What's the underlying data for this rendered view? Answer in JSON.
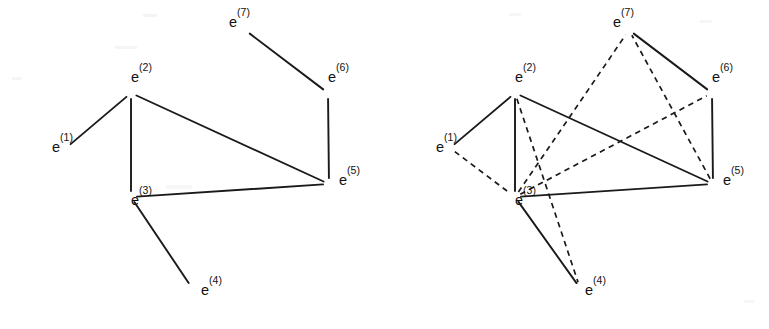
{
  "figure": {
    "title": "",
    "background_color": "#ffffff",
    "line_color": "#1a1a1a",
    "panels": [
      {
        "id": "left",
        "name": "left-graph",
        "caption": "",
        "origin_x": 0,
        "nodes": [
          {
            "id": "e1",
            "base": "e",
            "sup": "(1)",
            "label": "e(1)",
            "x": 52,
            "y": 152,
            "anchor_x": 66,
            "anchor_y": 148
          },
          {
            "id": "e2",
            "base": "e",
            "sup": "(2)",
            "label": "e(2)",
            "x": 131,
            "y": 82,
            "anchor_x": 131,
            "anchor_y": 93
          },
          {
            "id": "e3",
            "base": "e",
            "sup": "(3)",
            "label": "e(3)",
            "x": 131,
            "y": 205,
            "anchor_x": 131,
            "anchor_y": 197
          },
          {
            "id": "e4",
            "base": "e",
            "sup": "(4)",
            "label": "e(4)",
            "x": 201,
            "y": 295,
            "anchor_x": 192,
            "anchor_y": 288
          },
          {
            "id": "e5",
            "base": "e",
            "sup": "(5)",
            "label": "e(5)",
            "x": 339,
            "y": 185,
            "anchor_x": 329,
            "anchor_y": 184
          },
          {
            "id": "e6",
            "base": "e",
            "sup": "(6)",
            "label": "e(6)",
            "x": 328,
            "y": 82,
            "anchor_x": 328,
            "anchor_y": 93
          },
          {
            "id": "e7",
            "base": "e",
            "sup": "(7)",
            "label": "e(7)",
            "x": 229,
            "y": 27,
            "anchor_x": 245,
            "anchor_y": 30
          }
        ],
        "edges": [
          {
            "from": "e1",
            "to": "e2",
            "style": "solid"
          },
          {
            "from": "e2",
            "to": "e3",
            "style": "solid"
          },
          {
            "from": "e2",
            "to": "e5",
            "style": "solid"
          },
          {
            "from": "e3",
            "to": "e5",
            "style": "solid"
          },
          {
            "from": "e3",
            "to": "e4",
            "style": "solid"
          },
          {
            "from": "e5",
            "to": "e6",
            "style": "solid"
          },
          {
            "from": "e6",
            "to": "e7",
            "style": "solid"
          }
        ]
      },
      {
        "id": "right",
        "name": "right-graph",
        "caption": "",
        "origin_x": 384,
        "nodes": [
          {
            "id": "e1",
            "base": "e",
            "sup": "(1)",
            "label": "e(1)",
            "x": 52,
            "y": 152,
            "anchor_x": 66,
            "anchor_y": 148
          },
          {
            "id": "e2",
            "base": "e",
            "sup": "(2)",
            "label": "e(2)",
            "x": 131,
            "y": 82,
            "anchor_x": 131,
            "anchor_y": 93
          },
          {
            "id": "e3",
            "base": "e",
            "sup": "(3)",
            "label": "e(3)",
            "x": 131,
            "y": 205,
            "anchor_x": 131,
            "anchor_y": 197
          },
          {
            "id": "e4",
            "base": "e",
            "sup": "(4)",
            "label": "e(4)",
            "x": 201,
            "y": 295,
            "anchor_x": 196,
            "anchor_y": 288
          },
          {
            "id": "e5",
            "base": "e",
            "sup": "(5)",
            "label": "e(5)",
            "x": 339,
            "y": 185,
            "anchor_x": 329,
            "anchor_y": 184
          },
          {
            "id": "e6",
            "base": "e",
            "sup": "(6)",
            "label": "e(6)",
            "x": 328,
            "y": 82,
            "anchor_x": 328,
            "anchor_y": 93
          },
          {
            "id": "e7",
            "base": "e",
            "sup": "(7)",
            "label": "e(7)",
            "x": 229,
            "y": 27,
            "anchor_x": 245,
            "anchor_y": 30
          }
        ],
        "edges": [
          {
            "from": "e1",
            "to": "e2",
            "style": "solid"
          },
          {
            "from": "e2",
            "to": "e3",
            "style": "solid"
          },
          {
            "from": "e2",
            "to": "e5",
            "style": "solid"
          },
          {
            "from": "e3",
            "to": "e5",
            "style": "solid"
          },
          {
            "from": "e3",
            "to": "e4",
            "style": "solid"
          },
          {
            "from": "e5",
            "to": "e6",
            "style": "solid"
          },
          {
            "from": "e6",
            "to": "e7",
            "style": "solid"
          },
          {
            "from": "e1",
            "to": "e3",
            "style": "dashed"
          },
          {
            "from": "e2",
            "to": "e4",
            "style": "dashed"
          },
          {
            "from": "e3",
            "to": "e7",
            "style": "dashed"
          },
          {
            "from": "e3",
            "to": "e6",
            "style": "dashed"
          },
          {
            "from": "e5",
            "to": "e7",
            "style": "dashed"
          }
        ]
      }
    ],
    "legend": {
      "solid_meaning": "",
      "dashed_meaning": ""
    }
  }
}
